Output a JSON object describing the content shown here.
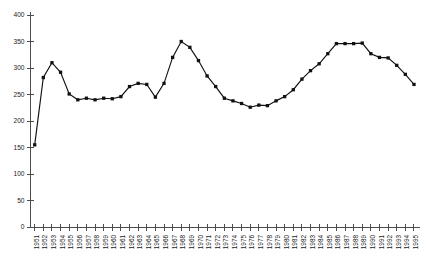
{
  "chart_data": {
    "type": "line",
    "title": "",
    "xlabel": "",
    "ylabel": "",
    "ylim": [
      0,
      400
    ],
    "ytick_step": 50,
    "grid": false,
    "legend": false,
    "marker": "square",
    "line_color": "#111111",
    "marker_color": "#111111",
    "axis_color": "#4d4d4d",
    "ytick_labels": [
      "0",
      "50",
      "100",
      "150",
      "200",
      "250",
      "300",
      "350",
      "400"
    ],
    "ytick_values": [
      0,
      50,
      100,
      150,
      200,
      250,
      300,
      350,
      400
    ],
    "categories": [
      "1951",
      "1952",
      "1953",
      "1954",
      "1955",
      "1956",
      "1957",
      "1958",
      "1959",
      "1960",
      "1961",
      "1962",
      "1963",
      "1964",
      "1965",
      "1966",
      "1967",
      "1968",
      "1969",
      "1970",
      "1971",
      "1972",
      "1973",
      "1974",
      "1975",
      "1976",
      "1977",
      "1978",
      "1979",
      "1980",
      "1981",
      "1982",
      "1983",
      "1984",
      "1985",
      "1986",
      "1987",
      "1988",
      "1989",
      "1990",
      "1991",
      "1992",
      "1993",
      "1994",
      "1995"
    ],
    "values": [
      155,
      282,
      310,
      292,
      251,
      240,
      243,
      240,
      243,
      242,
      246,
      265,
      271,
      269,
      245,
      271,
      320,
      350,
      339,
      314,
      285,
      265,
      243,
      238,
      233,
      226,
      230,
      229,
      238,
      246,
      259,
      279,
      295,
      308,
      327,
      346,
      346,
      346,
      347,
      327,
      320,
      319,
      305,
      288,
      269
    ]
  }
}
